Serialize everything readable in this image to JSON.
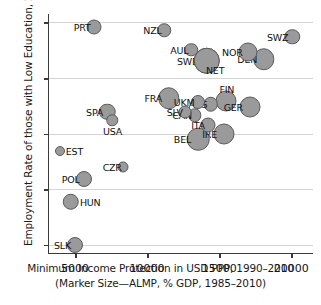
{
  "chart_data": {
    "type": "scatter",
    "title": "",
    "xlabel": "Minimum Income Protection in USD PPP, 1990–2010",
    "xlabel_line2": "(Marker Size—ALMP, % GDP, 1985–2010)",
    "ylabel": "Employment Rate of those with Low Education, 2011",
    "xlim": [
      3200,
      21500
    ],
    "ylim": [
      28.5,
      71.5
    ],
    "xticks": [
      5000,
      10000,
      15000,
      20000
    ],
    "yticks": [
      30,
      40,
      50,
      60,
      70
    ],
    "grid": true,
    "legend": "none",
    "marker_color": "#9a9a9a",
    "marker_edge_color": "#5a5a5a",
    "size_meaning": "ALMP, % GDP, 1985-2010",
    "points": [
      {
        "label": "PRT",
        "x": 6320,
        "y": 69.2,
        "size": 13.0,
        "label_pos": "left"
      },
      {
        "label": "NZL",
        "x": 11200,
        "y": 68.6,
        "size": 11.5,
        "label_pos": "left"
      },
      {
        "label": "SWZ",
        "x": 20050,
        "y": 67.4,
        "size": 13.5,
        "label_pos": "left"
      },
      {
        "label": "AUL",
        "x": 13050,
        "y": 65.1,
        "size": 11.5,
        "label_pos": "left"
      },
      {
        "label": "NOR",
        "x": 17000,
        "y": 64.6,
        "size": 17.0,
        "label_pos": "left"
      },
      {
        "label": "DEN",
        "x": 18100,
        "y": 63.4,
        "size": 19.5,
        "label_pos": "left"
      },
      {
        "label": "SWE",
        "x": 14150,
        "y": 63.1,
        "size": 24.5,
        "label_pos": "left"
      },
      {
        "label": "NET",
        "x": 14150,
        "y": 63.1,
        "size": 24.5,
        "label_pos": "right-below"
      },
      {
        "label": "FRA",
        "x": 11500,
        "y": 56.3,
        "size": 19.5,
        "label_pos": "left"
      },
      {
        "label": "UKM",
        "x": 13500,
        "y": 55.7,
        "size": 12.0,
        "label_pos": "left"
      },
      {
        "label": "FIN",
        "x": 15450,
        "y": 55.9,
        "size": 19.0,
        "label_pos": "left-above"
      },
      {
        "label": "AUS",
        "x": 14400,
        "y": 55.3,
        "size": 12.5,
        "label_pos": "left"
      },
      {
        "label": "GER",
        "x": 17100,
        "y": 54.7,
        "size": 19.0,
        "label_pos": "left"
      },
      {
        "label": "SPA",
        "x": 7250,
        "y": 53.9,
        "size": 14.5,
        "label_pos": "left"
      },
      {
        "label": "SLV",
        "x": 12650,
        "y": 53.8,
        "size": 11.0,
        "label_pos": "left"
      },
      {
        "label": "CAN",
        "x": 13300,
        "y": 53.3,
        "size": 11.5,
        "label_pos": "left"
      },
      {
        "label": "USA",
        "x": 7600,
        "y": 52.4,
        "size": 9.5,
        "label_pos": "below"
      },
      {
        "label": "ITA",
        "x": 14250,
        "y": 51.5,
        "size": 13.0,
        "label_pos": "left"
      },
      {
        "label": "IRE",
        "x": 15300,
        "y": 50.0,
        "size": 19.0,
        "label_pos": "left"
      },
      {
        "label": "BEL",
        "x": 13550,
        "y": 49.0,
        "size": 20.5,
        "label_pos": "left"
      },
      {
        "label": "EST",
        "x": 3950,
        "y": 46.8,
        "size": 8.0,
        "label_pos": "right"
      },
      {
        "label": "CZR",
        "x": 8350,
        "y": 43.9,
        "size": 9.0,
        "label_pos": "left"
      },
      {
        "label": "POL",
        "x": 5600,
        "y": 41.8,
        "size": 14.0,
        "label_pos": "left"
      },
      {
        "label": "HUN",
        "x": 4700,
        "y": 37.7,
        "size": 14.5,
        "label_pos": "right"
      },
      {
        "label": "SLK",
        "x": 5000,
        "y": 29.9,
        "size": 14.0,
        "label_pos": "left"
      }
    ]
  }
}
